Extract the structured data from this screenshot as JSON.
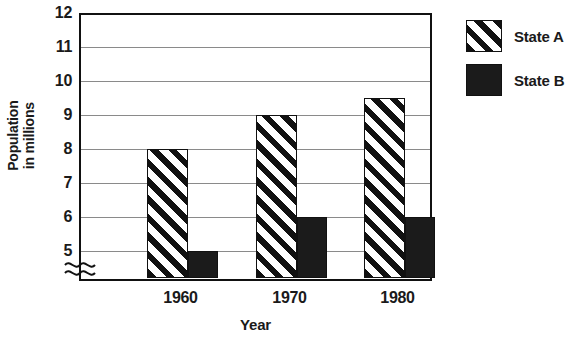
{
  "chart_data": {
    "type": "bar",
    "title": "",
    "xlabel": "Year",
    "ylabel": "Population\nin millions",
    "categories": [
      "1960",
      "1970",
      "1980"
    ],
    "series": [
      {
        "name": "State A",
        "values": [
          8,
          9,
          9.5
        ],
        "fill": "diagonal-hatch"
      },
      {
        "name": "State B",
        "values": [
          5,
          6,
          6
        ],
        "fill": "solid-black"
      }
    ],
    "ylim": [
      4.5,
      12
    ],
    "yticks": [
      12,
      11,
      10,
      9,
      8,
      7,
      6,
      5
    ],
    "ytick_labels": [
      "12",
      "11",
      "10",
      "9",
      "8",
      "7",
      "6",
      "5"
    ],
    "axis_break": true,
    "axis_break_symbol": "≈",
    "grid": true,
    "grid_axis": "y",
    "legend_position": "right",
    "colors": {
      "axis": "#111111",
      "gridline": "#8a8a8a",
      "series_b_fill": "#1b1b1b",
      "background": "#ffffff"
    }
  },
  "axes": {
    "y_title_line1": "Population",
    "y_title_line2": "in millions",
    "x_title": "Year"
  },
  "legend": {
    "items": [
      {
        "label": "State A",
        "swatch": "hatched-swatch-icon"
      },
      {
        "label": "State B",
        "swatch": "solid-swatch-icon"
      }
    ]
  }
}
